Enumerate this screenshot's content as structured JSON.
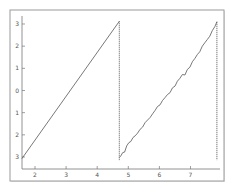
{
  "chart_data": {
    "type": "line",
    "title": "",
    "xlabel": "",
    "ylabel": "",
    "xlim": [
      1.57,
      7.85
    ],
    "ylim": [
      -3.3,
      3.3
    ],
    "grid": false,
    "legend": null,
    "x_ticks": [
      2,
      3,
      4,
      5,
      6,
      7
    ],
    "x_tick_labels": [
      "2",
      "3",
      "4",
      "5",
      "6",
      "7"
    ],
    "y_ticks": [
      3,
      2,
      1,
      0,
      -1,
      -2,
      -3
    ],
    "y_tick_labels": [
      "3",
      "2",
      "1",
      "0",
      "1",
      "2",
      "3"
    ],
    "series": [
      {
        "name": "ramp-1",
        "style": "solid",
        "color": "#555555",
        "x": [
          1.58,
          4.71
        ],
        "y": [
          -3.07,
          3.12
        ]
      },
      {
        "name": "wrap-1",
        "style": "dotted",
        "color": "#555555",
        "x": [
          4.71,
          4.71
        ],
        "y": [
          3.12,
          -3.14
        ]
      },
      {
        "name": "ramp-2-noisy",
        "style": "solid",
        "color": "#555555",
        "x": [
          4.71,
          4.76,
          4.82,
          4.88,
          4.95,
          5.02,
          5.08,
          5.15,
          5.22,
          5.3,
          5.38,
          5.46,
          5.54,
          5.62,
          5.7,
          5.78,
          5.86,
          5.94,
          6.02,
          6.1,
          6.18,
          6.26,
          6.34,
          6.42,
          6.5,
          6.58,
          6.66,
          6.74,
          6.82,
          6.9,
          6.98,
          7.06,
          7.14,
          7.22,
          7.3,
          7.38,
          7.46,
          7.54,
          7.62,
          7.7,
          7.78,
          7.85
        ],
        "y": [
          -3.02,
          -2.95,
          -2.8,
          -2.78,
          -2.5,
          -2.35,
          -2.3,
          -2.12,
          -2.05,
          -1.92,
          -1.75,
          -1.65,
          -1.45,
          -1.33,
          -1.22,
          -1.05,
          -0.9,
          -0.72,
          -0.65,
          -0.45,
          -0.32,
          -0.18,
          -0.1,
          0.12,
          0.2,
          0.42,
          0.55,
          0.72,
          0.7,
          0.95,
          1.05,
          1.3,
          1.45,
          1.62,
          1.75,
          2.0,
          2.15,
          2.3,
          2.45,
          2.7,
          2.88,
          3.1
        ]
      },
      {
        "name": "wrap-2",
        "style": "dotted",
        "color": "#555555",
        "x": [
          7.85,
          7.85
        ],
        "y": [
          3.1,
          -3.14
        ]
      }
    ]
  },
  "frame": {
    "outer_border_color": "#9a9a9a",
    "axis_color": "#777777",
    "line_color": "#555555"
  }
}
